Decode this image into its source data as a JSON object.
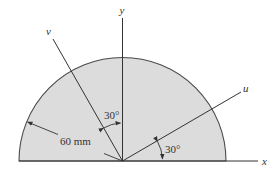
{
  "figure": {
    "colors": {
      "fill": "#dcdcdc",
      "stroke": "#4a4a4a",
      "axis": "#333333",
      "background": "#ffffff"
    },
    "shape": {
      "type": "semicircle",
      "radius_label": "60 mm"
    },
    "axes": {
      "x": {
        "label": "x"
      },
      "y": {
        "label": "y"
      },
      "u": {
        "label": "u",
        "angle_from_x_deg": 30
      },
      "v": {
        "label": "v",
        "angle_from_y_deg": 30
      }
    },
    "angles": {
      "v_to_y": {
        "label": "30°"
      },
      "x_to_u": {
        "label": "30°"
      }
    },
    "dimension": {
      "radius": {
        "label": "60 mm"
      }
    }
  }
}
